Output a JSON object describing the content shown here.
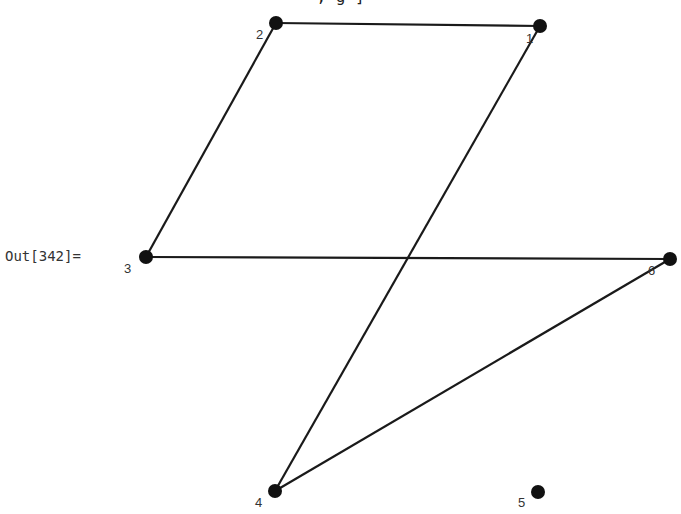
{
  "cell": {
    "out_label": "Out[342]=",
    "clipped_input_text": ",  g                              ]"
  },
  "graph": {
    "nodes": [
      {
        "id": "1",
        "x": 540,
        "y": 26,
        "label_dx": -14,
        "label_dy": 17
      },
      {
        "id": "2",
        "x": 276,
        "y": 23,
        "label_dx": -20,
        "label_dy": 16
      },
      {
        "id": "3",
        "x": 146,
        "y": 257,
        "label_dx": -22,
        "label_dy": 16
      },
      {
        "id": "4",
        "x": 275,
        "y": 491,
        "label_dx": -20,
        "label_dy": 16
      },
      {
        "id": "5",
        "x": 538,
        "y": 492,
        "label_dx": -20,
        "label_dy": 15
      },
      {
        "id": "6",
        "x": 670,
        "y": 259,
        "label_dx": -22,
        "label_dy": 16
      }
    ],
    "edges": [
      [
        "1",
        "2"
      ],
      [
        "2",
        "3"
      ],
      [
        "3",
        "6"
      ],
      [
        "1",
        "4"
      ],
      [
        "4",
        "6"
      ]
    ],
    "colors": {
      "edge": "#1a1a1a",
      "node": "#111111",
      "label": "#333333"
    }
  }
}
